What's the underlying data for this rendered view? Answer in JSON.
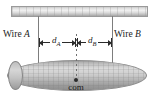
{
  "figure": {
    "labels": {
      "wire_a": "Wire A",
      "wire_b": "Wire B",
      "distance_a": "d",
      "distance_a_sub": "A",
      "distance_b": "d",
      "distance_b_sub": "B",
      "com": "com"
    },
    "colors": {
      "line": "#2b2b2b",
      "wire": "#7d7d7d",
      "ceiling_fill": "#dcdcdc",
      "rod_fill": "#c4c4c4",
      "dash": "#6f6f6f",
      "background": "#ffffff"
    },
    "geometry": {
      "ceiling_span_px": 137,
      "wire_a_x_px": 38,
      "wire_b_x_px": 112,
      "com_x_px": 76,
      "rod_width_px": 140,
      "rod_height_px": 31
    }
  }
}
